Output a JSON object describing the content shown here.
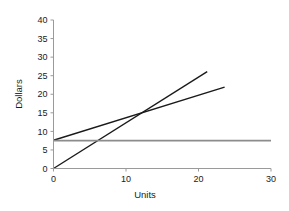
{
  "chart_data": {
    "type": "line",
    "title": "",
    "xlabel": "Units",
    "ylabel": "Dollars",
    "xlim": [
      0,
      30
    ],
    "ylim": [
      0,
      40
    ],
    "xticks": [
      0,
      10,
      20,
      30
    ],
    "yticks": [
      0,
      5,
      10,
      15,
      20,
      25,
      30,
      35,
      40
    ],
    "xtick_labels": [
      "0",
      "10",
      "20",
      "30"
    ],
    "ytick_labels": [
      "0",
      "5",
      "10",
      "15",
      "20",
      "25",
      "30",
      "35",
      "40"
    ],
    "grid": false,
    "legend": null,
    "series": [
      {
        "name": "total-revenue-line",
        "color": "#1a1a1a",
        "points": [
          [
            0,
            0
          ],
          [
            21.2,
            26.1
          ]
        ]
      },
      {
        "name": "total-cost-line",
        "color": "#1a1a1a",
        "points": [
          [
            0,
            7.6
          ],
          [
            23.6,
            21.9
          ]
        ]
      },
      {
        "name": "fixed-cost-line",
        "color": "#8c8c8c",
        "points": [
          [
            0,
            7.5
          ],
          [
            30,
            7.5
          ]
        ]
      }
    ],
    "annotations": [
      {
        "name": "breakeven-intersection",
        "x": 11.8,
        "y": 15.0
      }
    ]
  },
  "axis": {
    "x_label": "Units",
    "y_label": "Dollars"
  },
  "colors": {
    "axis": "#9a9a9a",
    "text": "#1a1a1a",
    "line_dark": "#1a1a1a",
    "line_gray": "#8c8c8c",
    "background": "#ffffff"
  }
}
